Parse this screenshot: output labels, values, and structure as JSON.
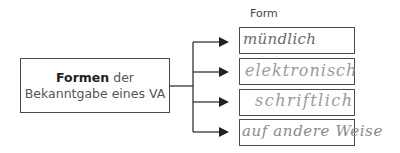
{
  "main": {
    "title_bold": "Formen",
    "title_rest": " der",
    "subtitle": "Bekanntgabe eines VA"
  },
  "forms": {
    "header": "Form",
    "items": [
      {
        "answer": "mündlich",
        "ink": "#6a6a6a"
      },
      {
        "answer": "elektronisch",
        "ink": "#9a9a9a"
      },
      {
        "answer": "schriftlich",
        "ink": "#9a9a9a"
      },
      {
        "answer": "auf andere Weise",
        "ink": "#8a8a8a"
      }
    ]
  },
  "colors": {
    "line": "#333333",
    "border": "#4a4a4a"
  }
}
